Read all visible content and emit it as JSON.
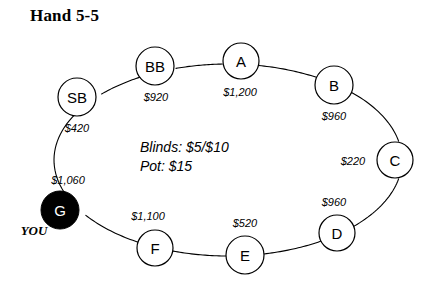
{
  "title": "Hand 5-5",
  "diagram": {
    "type": "poker-table-seating",
    "table": {
      "center_x": 228,
      "center_y": 160,
      "radius_x": 174,
      "radius_y": 96,
      "outline_color": "#000000"
    },
    "hero_fill": "#000000",
    "seat_fill": "#ffffff",
    "seat_stroke": "#000000",
    "center_info": [
      "Blinds: $5/$10",
      "Pot: $15"
    ],
    "center_info_x": 140,
    "center_info_y": 147,
    "hero_marker": {
      "label": "YOU",
      "x": 34,
      "y": 230
    },
    "seats": [
      {
        "id": "seat-sb",
        "label": "SB",
        "stack": "$420",
        "cx": 77,
        "cy": 97,
        "r": 19,
        "stack_x": 77,
        "stack_y": 128,
        "hero": false
      },
      {
        "id": "seat-bb",
        "label": "BB",
        "stack": "$920",
        "cx": 155,
        "cy": 66,
        "r": 19,
        "stack_x": 156,
        "stack_y": 97,
        "hero": false
      },
      {
        "id": "seat-a",
        "label": "A",
        "stack": "$1,200",
        "cx": 241,
        "cy": 61,
        "r": 18,
        "stack_x": 240,
        "stack_y": 92,
        "hero": false
      },
      {
        "id": "seat-b",
        "label": "B",
        "stack": "$960",
        "cx": 334,
        "cy": 85,
        "r": 19,
        "stack_x": 334,
        "stack_y": 116,
        "hero": false
      },
      {
        "id": "seat-c",
        "label": "C",
        "stack": "$220",
        "cx": 395,
        "cy": 160,
        "r": 18,
        "stack_x": 353,
        "stack_y": 161,
        "hero": false
      },
      {
        "id": "seat-d",
        "label": "D",
        "stack": "$960",
        "cx": 337,
        "cy": 233,
        "r": 18,
        "stack_x": 334,
        "stack_y": 202,
        "hero": false
      },
      {
        "id": "seat-e",
        "label": "E",
        "stack": "$520",
        "cx": 245,
        "cy": 255,
        "r": 19,
        "stack_x": 245,
        "stack_y": 223,
        "hero": false
      },
      {
        "id": "seat-f",
        "label": "F",
        "stack": "$1,100",
        "cx": 155,
        "cy": 248,
        "r": 18,
        "stack_x": 148,
        "stack_y": 216,
        "hero": false
      },
      {
        "id": "seat-g",
        "label": "G",
        "stack": "$1,060",
        "cx": 60,
        "cy": 210,
        "r": 19,
        "stack_x": 68,
        "stack_y": 180,
        "hero": true
      }
    ]
  }
}
